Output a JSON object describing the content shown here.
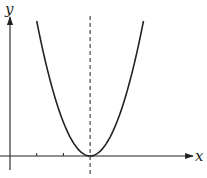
{
  "chart_data": {
    "type": "line",
    "title": "",
    "xlabel": "x",
    "ylabel": "y",
    "series": [
      {
        "name": "parabola",
        "function": "y = (x - 3)^2",
        "x": [
          1,
          1.5,
          2,
          2.5,
          3,
          3.5,
          4,
          4.5,
          5
        ],
        "y": [
          4,
          2.25,
          1,
          0.25,
          0,
          0.25,
          1,
          2.25,
          4
        ]
      }
    ],
    "axis_of_symmetry": {
      "x": 3,
      "style": "dashed"
    },
    "x_ticks": [
      1,
      2
    ],
    "xlim": [
      0,
      6.5
    ],
    "ylim": [
      -0.7,
      5.5
    ],
    "grid": false,
    "legend": "none"
  }
}
